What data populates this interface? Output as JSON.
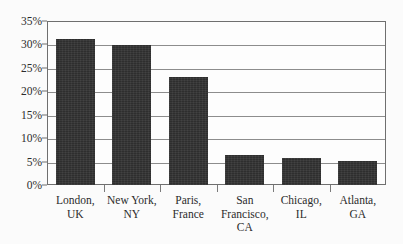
{
  "chart_data": {
    "type": "bar",
    "title": "",
    "subtitle": "",
    "xlabel": "",
    "ylabel": "",
    "categories": [
      "London, UK",
      "New York, NY",
      "Paris, France",
      "San Francisco, CA",
      "Chicago, IL",
      "Atlanta, GA"
    ],
    "category_lines": [
      [
        "London,",
        "UK"
      ],
      [
        "New York,",
        "NY"
      ],
      [
        "Paris,",
        "France"
      ],
      [
        "San",
        "Francisco,",
        "CA"
      ],
      [
        "Chicago,",
        "IL"
      ],
      [
        "Atlanta,",
        "GA"
      ]
    ],
    "values": [
      31.2,
      29.9,
      23.0,
      6.4,
      5.8,
      5.2
    ],
    "value_labels": [
      "31.2%",
      "29.9%",
      "23.0%",
      "6.4%",
      "5.8%",
      "5.2%"
    ],
    "ylim": [
      0,
      35
    ],
    "ytick_values": [
      0,
      5,
      10,
      15,
      20,
      25,
      30,
      35
    ],
    "ytick_labels": [
      "0%",
      "5%",
      "10%",
      "15%",
      "20%",
      "25%",
      "30%",
      "35%"
    ],
    "grid": true,
    "grid_axis": "y",
    "legend": false,
    "legend_position": "none",
    "series": [
      {
        "name": "Share",
        "values": [
          31.2,
          29.9,
          23.0,
          6.4,
          5.8,
          5.2
        ],
        "color": "#2e2e2e"
      }
    ]
  },
  "colors": {
    "bar_fill": "#2e2e2e",
    "gridline": "#8d8d8d",
    "axis_border": "#6f6f6f",
    "text": "#2b2b2b",
    "background": "#fbfbfb",
    "plot_background": "#fdfdfd"
  }
}
